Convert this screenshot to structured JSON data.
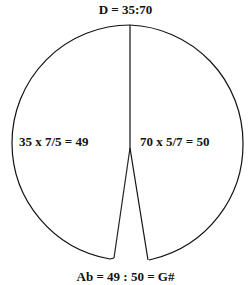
{
  "diagram": {
    "title_top": "D = 35:70",
    "left_region_label": "35 x 7/5 = 49",
    "right_region_label": "70 x 5/7 = 50",
    "bottom_label": "Ab = 49 : 50 = G#",
    "colors": {
      "stroke": "#111111",
      "text": "#111111",
      "background": "#ffffff"
    }
  }
}
